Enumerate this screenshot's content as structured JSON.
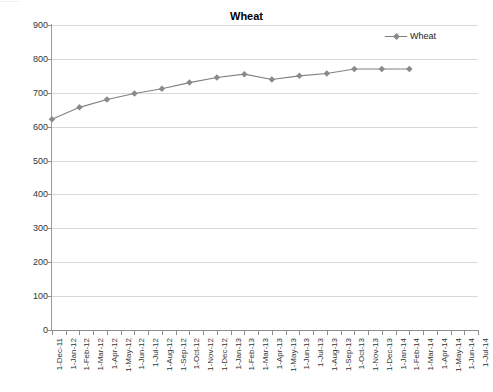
{
  "page": {
    "top_cut_text": "........."
  },
  "chart_panel": {
    "title": "Wheat",
    "legend": [
      {
        "label": "Wheat",
        "color": "#808080",
        "marker": "diamond"
      }
    ]
  },
  "chart_data": {
    "type": "line",
    "title": "Wheat",
    "xlabel": "",
    "ylabel": "",
    "ylim": [
      0,
      900
    ],
    "ytick_step": 100,
    "yticks": [
      0,
      100,
      200,
      300,
      400,
      500,
      600,
      700,
      800,
      900
    ],
    "grid": true,
    "legend_position": "top-right",
    "categories": [
      "1-Dec-11",
      "1-Jan-12",
      "1-Feb-12",
      "1-Mar-12",
      "1-Apr-12",
      "1-May-12",
      "1-Jun-12",
      "1-Jul-12",
      "1-Aug-12",
      "1-Sep-12",
      "1-Oct-12",
      "1-Nov-12",
      "1-Dec-12",
      "1-Jan-13",
      "1-Feb-13",
      "1-Mar-13",
      "1-Apr-13",
      "1-May-13",
      "1-Jun-13",
      "1-Jul-13",
      "1-Aug-13",
      "1-Sep-13",
      "1-Oct-13",
      "1-Nov-13",
      "1-Dec-13",
      "1-Jan-14",
      "1-Feb-14",
      "1-Mar-14",
      "1-Apr-14",
      "1-May-14",
      "1-Jun-14",
      "1-Jul-14"
    ],
    "series": [
      {
        "name": "Wheat",
        "color": "#808080",
        "marker": "diamond",
        "points": [
          {
            "x": "1-Dec-11",
            "y": 622
          },
          {
            "x": "1-Feb-12",
            "y": 657
          },
          {
            "x": "1-Apr-12",
            "y": 680
          },
          {
            "x": "1-Jun-12",
            "y": 698
          },
          {
            "x": "1-Aug-12",
            "y": 712
          },
          {
            "x": "1-Oct-12",
            "y": 730
          },
          {
            "x": "1-Dec-12",
            "y": 745
          },
          {
            "x": "1-Feb-13",
            "y": 755
          },
          {
            "x": "1-Apr-13",
            "y": 739
          },
          {
            "x": "1-Jun-13",
            "y": 750
          },
          {
            "x": "1-Aug-13",
            "y": 757
          },
          {
            "x": "1-Oct-13",
            "y": 770
          },
          {
            "x": "1-Dec-13",
            "y": 770
          },
          {
            "x": "1-Feb-14",
            "y": 770
          }
        ]
      }
    ]
  }
}
